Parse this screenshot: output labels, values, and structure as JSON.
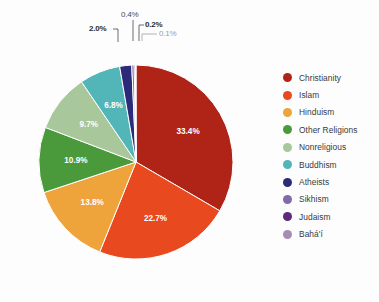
{
  "title_remnant": "",
  "chart_data": {
    "type": "pie",
    "title": "",
    "subtitle": "",
    "xlabel": "",
    "ylabel": "",
    "legend_position": "right",
    "grid": false,
    "value_unit": "%",
    "start_angle_deg": 0,
    "direction": "clockwise",
    "categories": [
      "Christianity",
      "Islam",
      "Hinduism",
      "Other Religions",
      "Nonreligious",
      "Buddhism",
      "Atheists",
      "Sikhism",
      "Judaism",
      "Bahá'í"
    ],
    "values": [
      33.4,
      22.7,
      13.8,
      10.9,
      9.7,
      6.8,
      2.0,
      0.4,
      0.2,
      0.1
    ],
    "labels": [
      "33.4%",
      "22.7%",
      "13.8%",
      "10.9%",
      "9.7%",
      "6.8%",
      "2.0%",
      "0.4%",
      "0.2%",
      "0.1%"
    ],
    "colors": [
      "#b02418",
      "#e8491f",
      "#efa43b",
      "#4a9a3c",
      "#a8c79a",
      "#52b5b8",
      "#2b2b7a",
      "#7e6ba8",
      "#5b2a78",
      "#a78cb4"
    ],
    "label_placement": [
      "inside",
      "inside",
      "inside",
      "inside",
      "inside",
      "inside",
      "callout",
      "callout",
      "callout",
      "callout"
    ],
    "slice_border_color": "#ffffff"
  },
  "callouts": {
    "atheists": "2.0%",
    "sikhism": "0.4%",
    "judaism": "0.2%",
    "bahai": "0.1%"
  },
  "slice_labels": {
    "christianity": "33.4%",
    "islam": "22.7%",
    "hinduism": "13.8%",
    "other_religions": "10.9%",
    "nonreligious": "9.7%",
    "buddhism": "6.8%"
  },
  "legend": {
    "items": [
      {
        "label": "Christianity",
        "color": "#b02418"
      },
      {
        "label": "Islam",
        "color": "#e8491f"
      },
      {
        "label": "Hinduism",
        "color": "#efa43b"
      },
      {
        "label": "Other Religions",
        "color": "#4a9a3c"
      },
      {
        "label": "Nonreligious",
        "color": "#a8c79a"
      },
      {
        "label": "Buddhism",
        "color": "#52b5b8"
      },
      {
        "label": "Atheists",
        "color": "#2b2b7a"
      },
      {
        "label": "Sikhism",
        "color": "#7e6ba8"
      },
      {
        "label": "Judaism",
        "color": "#5b2a78"
      },
      {
        "label": "Bahá'í",
        "color": "#a78cb4"
      }
    ]
  }
}
